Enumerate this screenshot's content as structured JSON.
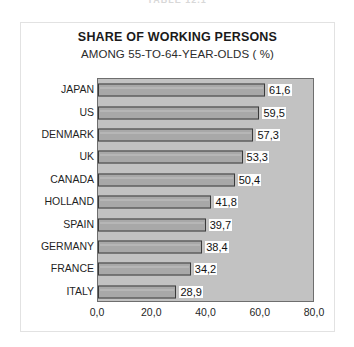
{
  "top_strip": {
    "clipped_text": "TABLE 12.1"
  },
  "chart_data": {
    "type": "bar",
    "orientation": "horizontal",
    "title": "SHARE OF WORKING PERSONS",
    "subtitle": "AMONG 55-TO-64-YEAR-OLDS ( %)",
    "xlabel": "",
    "ylabel": "",
    "xlim": [
      0,
      80
    ],
    "xticks": [
      0,
      20,
      40,
      60,
      80
    ],
    "xtick_labels": [
      "0,0",
      "20,0",
      "40,0",
      "60,0",
      "80,0"
    ],
    "grid": false,
    "legend": false,
    "decimal_separator": ",",
    "categories": [
      "JAPAN",
      "US",
      "DENMARK",
      "UK",
      "CANADA",
      "HOLLAND",
      "SPAIN",
      "GERMANY",
      "FRANCE",
      "ITALY"
    ],
    "values": [
      61.6,
      59.5,
      57.3,
      53.3,
      50.4,
      41.8,
      39.7,
      38.4,
      34.2,
      28.9
    ],
    "value_labels": [
      "61,6",
      "59,5",
      "57,3",
      "53,3",
      "50,4",
      "41,8",
      "39,7",
      "38,4",
      "34,2",
      "28,9"
    ],
    "colors": {
      "bar_fill": "#a8a8a8",
      "bar_border": "#3a3a3a",
      "plot_background": "#c2c2c2",
      "plot_border": "#6e6e6e",
      "page_background": "#ffffff",
      "frame_border": "#e2e2e2",
      "text": "#1f1f1f",
      "value_label_background": "#fdfdfd"
    }
  }
}
